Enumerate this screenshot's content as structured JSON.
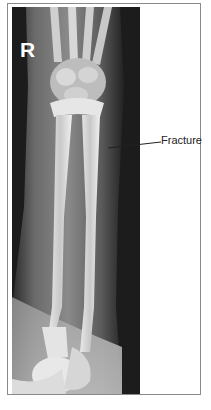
{
  "figure": {
    "side_marker": "R",
    "annotations": [
      {
        "label": "Fracture"
      }
    ]
  },
  "colors": {
    "background": "#ffffff",
    "border": "#8a8a8a",
    "xray_dark": "#1c1c1c",
    "label_text": "#222222"
  }
}
